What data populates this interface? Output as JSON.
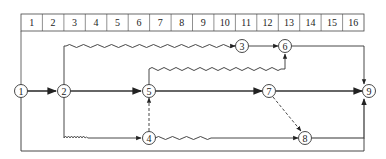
{
  "timescale": {
    "units": [
      "1",
      "2",
      "3",
      "4",
      "5",
      "6",
      "7",
      "8",
      "9",
      "10",
      "11",
      "12",
      "13",
      "14",
      "15",
      "16"
    ]
  },
  "nodes": [
    {
      "id": "1",
      "label": "1"
    },
    {
      "id": "2",
      "label": "2"
    },
    {
      "id": "3",
      "label": "3"
    },
    {
      "id": "4",
      "label": "4"
    },
    {
      "id": "5",
      "label": "5"
    },
    {
      "id": "6",
      "label": "6"
    },
    {
      "id": "7",
      "label": "7"
    },
    {
      "id": "8",
      "label": "8"
    },
    {
      "id": "9",
      "label": "9"
    }
  ],
  "edges": [
    {
      "from": "1",
      "to": "2",
      "style": "solid-bold"
    },
    {
      "from": "2",
      "to": "5",
      "style": "solid-bold"
    },
    {
      "from": "5",
      "to": "7",
      "style": "solid-bold"
    },
    {
      "from": "7",
      "to": "9",
      "style": "solid-bold"
    },
    {
      "from": "2",
      "to": "3",
      "style": "wavy-then-solid"
    },
    {
      "from": "3",
      "to": "6",
      "style": "solid"
    },
    {
      "from": "6",
      "to": "9",
      "style": "solid"
    },
    {
      "from": "5",
      "to": "6",
      "style": "wavy"
    },
    {
      "from": "2",
      "to": "4",
      "style": "zigzag-then-solid"
    },
    {
      "from": "4",
      "to": "5",
      "style": "dashed"
    },
    {
      "from": "4",
      "to": "8",
      "style": "wavy-then-solid"
    },
    {
      "from": "7",
      "to": "8",
      "style": "dashed"
    },
    {
      "from": "8",
      "to": "9",
      "style": "solid"
    },
    {
      "from": "1",
      "to": "9",
      "style": "solid"
    }
  ],
  "colors": {
    "line": "#333333",
    "background": "#ffffff"
  }
}
